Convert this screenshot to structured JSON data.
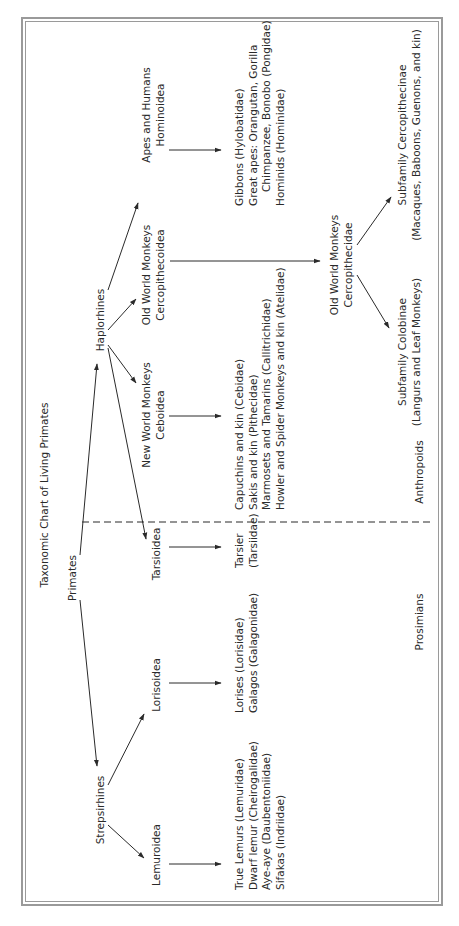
{
  "title": "Taxonomic Chart of Living Primates",
  "root": "Primates",
  "suborders": {
    "strepsirhines": "Strepsirhines",
    "haplorhines": "Haplorhines"
  },
  "superfamilies": {
    "lemuroidea": "Lemuroidea",
    "lorisoidea": "Lorisoidea",
    "tarsioidea": "Tarsioidea",
    "new_world": {
      "line1": "New World Monkeys",
      "line2": "Ceboidea"
    },
    "old_world": {
      "line1": "Old World Monkeys",
      "line2": "Cercopithecoidea"
    },
    "apes": {
      "line1": "Apes and Humans",
      "line2": "Hominoidea"
    }
  },
  "families": {
    "lemuroidea": [
      "True Lemurs (Lemuridae)",
      "Dwarf lemur (Cheirogalidae)",
      "Aye-aye (Daubentoniidae)",
      "Sifakas (Indriidae)"
    ],
    "lorisoidea": [
      "Lorises (Lorisidae)",
      "Galagos (Galagonidae)"
    ],
    "tarsioidea": [
      "Tarsier",
      "(Tarsiidae)"
    ],
    "new_world": [
      "Capuchins and kin (Cebidae)",
      "Sakis and kin (Pithecidae)",
      "Marmosets and Tamarins (Callitrichidae)",
      "Howler and Spider Monkeys and kin (Atelidae)"
    ],
    "old_world": {
      "line1": "Old World Monkeys",
      "line2": "Cercopithecidae"
    },
    "apes": [
      "Gibbons (Hylobatidae)",
      "Great apes: Orangutan, Gorilla",
      "Chimpanzee, Bonobo (Pongidae)",
      "Hominids (Hominidae)"
    ]
  },
  "subfamilies": {
    "colobinae": {
      "line1": "Subfamily Colobinae",
      "line2": "(Langurs and Leaf Monkeys)"
    },
    "cercopithecinae": {
      "line1": "Subfamily Cercopithecinae",
      "line2": "(Macaques, Baboons, Guenons, and kin)"
    }
  },
  "groups": {
    "left": "Prosimians",
    "right": "Anthropoids"
  },
  "colors": {
    "line": "#2a2a2a",
    "frame": "#9a9a9a",
    "background": "#ffffff"
  }
}
